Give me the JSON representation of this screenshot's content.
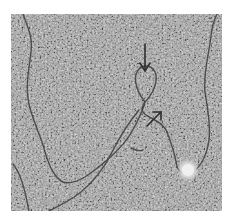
{
  "image": {
    "kind": "electron-micrograph",
    "description": "Grayscale electron micrograph of a DNA molecule with a loop structure",
    "colors": {
      "background": "#a9a9a9",
      "grain_dark": "#5a5a5a",
      "grain_light": "#cfcfcf",
      "strand": "#3c3c3c",
      "arrow": "#2e2e2e",
      "blob": "#eeeeee"
    },
    "annotations": [
      {
        "type": "arrow",
        "direction": "down",
        "label": "loop-pointer"
      },
      {
        "type": "arrow",
        "direction": "up-right",
        "label": "strand-pointer"
      }
    ],
    "features": [
      {
        "type": "bright-particle"
      },
      {
        "type": "dna-strand-loop"
      }
    ]
  }
}
